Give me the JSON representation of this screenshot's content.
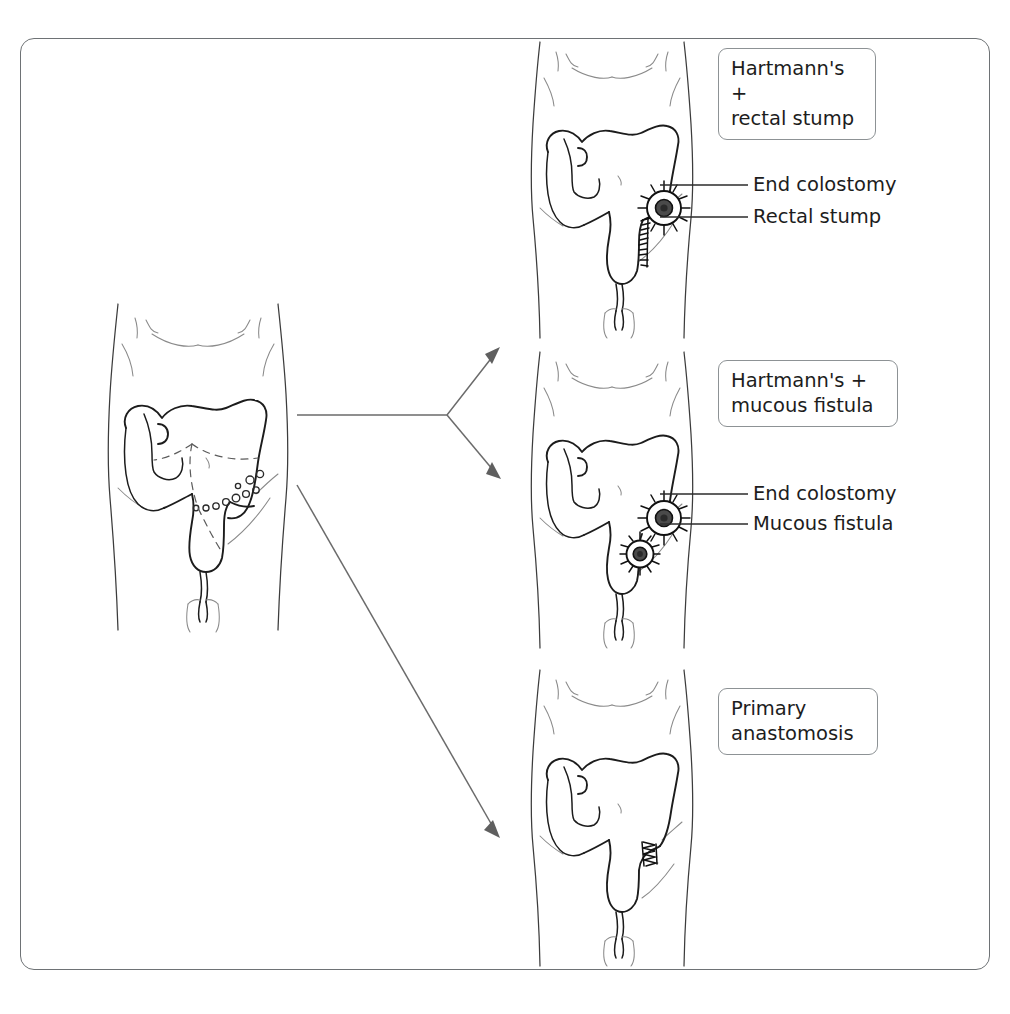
{
  "figure": {
    "title_present": false,
    "border_color": "#6e7275",
    "background": "#ffffff"
  },
  "source_panel": {
    "name": "diverticular-disease-sigmoid",
    "description_visible": false
  },
  "branches": [
    {
      "id": "hartmann-rectal-stump",
      "tag": "Hartmann's +\nrectal stump",
      "callouts": [
        {
          "id": "end-colostomy",
          "label": "End colostomy"
        },
        {
          "id": "rectal-stump",
          "label": "Rectal stump"
        }
      ]
    },
    {
      "id": "hartmann-mucous-fistula",
      "tag": "Hartmann's +\nmucous fistula",
      "callouts": [
        {
          "id": "end-colostomy",
          "label": "End colostomy"
        },
        {
          "id": "mucous-fistula",
          "label": "Mucous fistula"
        }
      ]
    },
    {
      "id": "primary-anastomosis",
      "tag": "Primary\nanastomosis",
      "callouts": []
    }
  ],
  "colors": {
    "ink": "#1c1c1c",
    "body_outline": "#3c3c3c",
    "arrow": "#6b6b6b",
    "tag_border": "#8d9295",
    "stoma_core": "#4a4a4a"
  }
}
